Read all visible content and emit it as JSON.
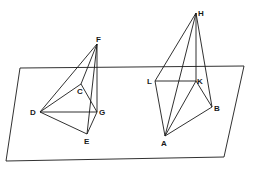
{
  "diagram": {
    "type": "geometry-3d",
    "plane": {
      "corners": [
        [
          20,
          68
        ],
        [
          244,
          66
        ],
        [
          224,
          157
        ],
        [
          6,
          161
        ]
      ]
    },
    "figure_left": {
      "points": {
        "F": [
          97,
          44
        ],
        "C": [
          81,
          84
        ],
        "D": [
          40,
          112
        ],
        "G": [
          97,
          112
        ],
        "E": [
          87,
          134
        ]
      },
      "labels": {
        "F": "F",
        "C": "C",
        "D": "D",
        "G": "G",
        "E": "E"
      },
      "edges": [
        [
          "F",
          "D"
        ],
        [
          "F",
          "C"
        ],
        [
          "F",
          "G"
        ],
        [
          "F",
          "E"
        ],
        [
          "C",
          "D"
        ],
        [
          "C",
          "G"
        ],
        [
          "D",
          "G"
        ],
        [
          "D",
          "E"
        ],
        [
          "G",
          "E"
        ]
      ]
    },
    "figure_right": {
      "points": {
        "H": [
          196,
          13
        ],
        "L": [
          155,
          81
        ],
        "K": [
          196,
          81
        ],
        "B": [
          212,
          107
        ],
        "A": [
          165,
          136
        ]
      },
      "labels": {
        "H": "H",
        "L": "L",
        "K": "K",
        "B": "B",
        "A": "A"
      },
      "edges": [
        [
          "H",
          "L"
        ],
        [
          "H",
          "K"
        ],
        [
          "H",
          "B"
        ],
        [
          "H",
          "A"
        ],
        [
          "L",
          "K"
        ],
        [
          "L",
          "A"
        ],
        [
          "K",
          "A"
        ],
        [
          "K",
          "B"
        ],
        [
          "A",
          "B"
        ]
      ]
    }
  }
}
